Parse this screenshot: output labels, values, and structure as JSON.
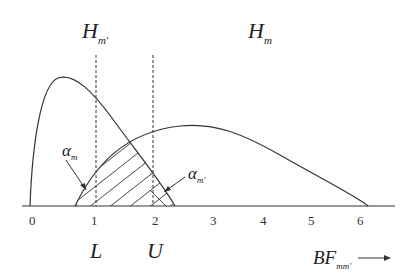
{
  "diagram": {
    "title_left": {
      "main": "H",
      "sub": "m'"
    },
    "title_right": {
      "main": "H",
      "sub": "m"
    },
    "x_axis": {
      "ticks": [
        "0",
        "1",
        "2",
        "3",
        "4",
        "5",
        "6"
      ],
      "label": {
        "main": "BF",
        "sub": "mm'"
      },
      "arrow": "⟶"
    },
    "thresholds": {
      "lower": "L",
      "upper": "U"
    },
    "regions": {
      "alpha_m": {
        "main": "α",
        "sub": "m"
      },
      "alpha_m_prime": {
        "main": "α",
        "sub": "m'"
      }
    },
    "colors": {
      "line": "#333333",
      "background": "#ffffff"
    }
  }
}
